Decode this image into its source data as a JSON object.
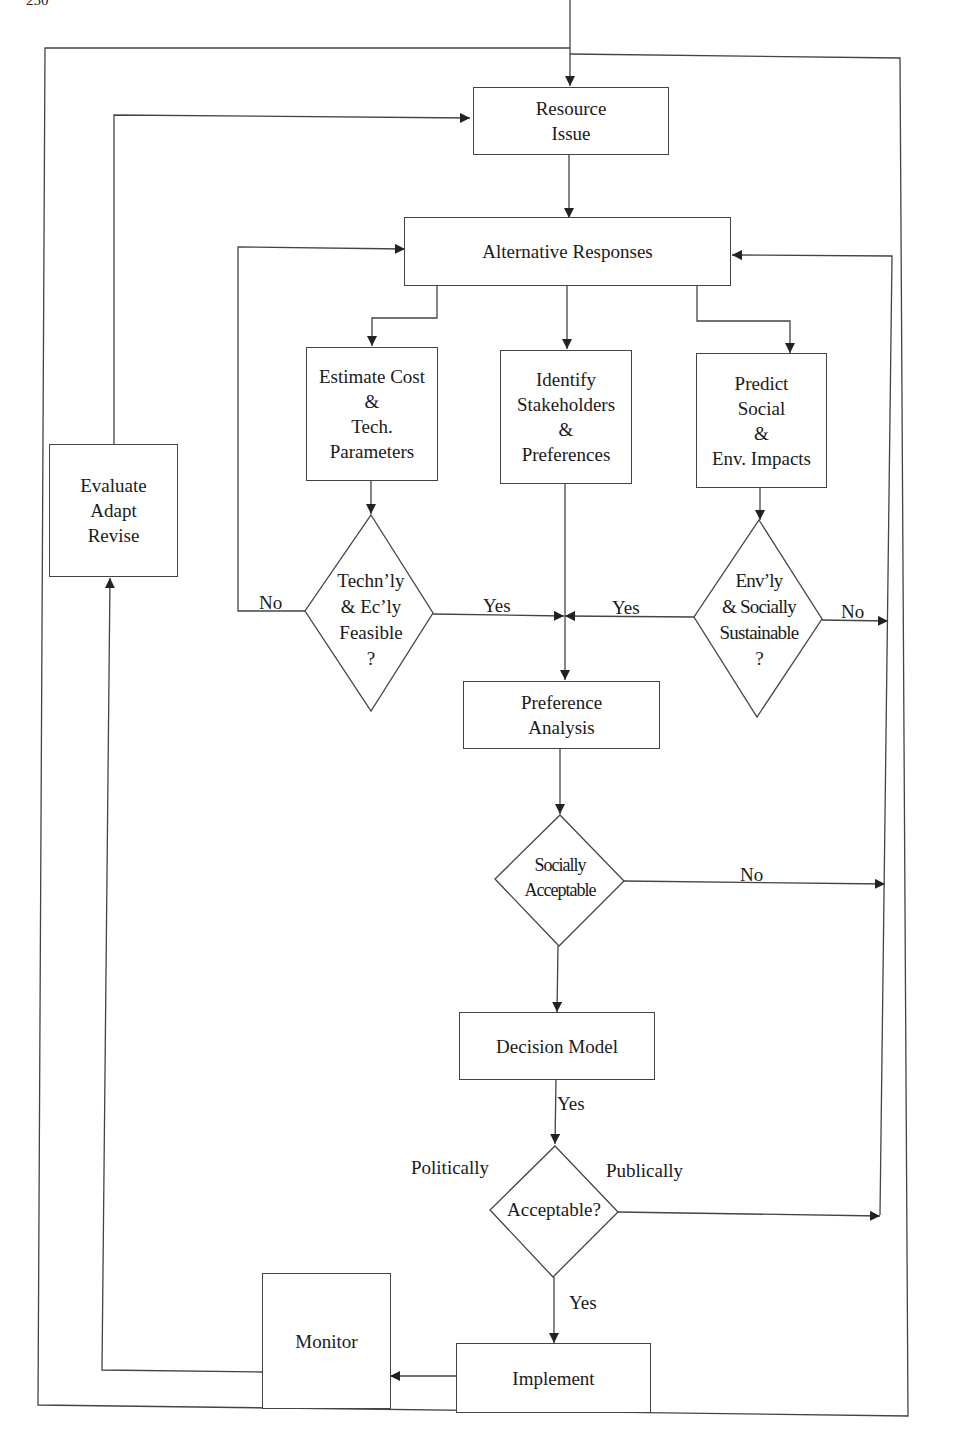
{
  "page_number": "250",
  "nodes": {
    "resource_issue": [
      "Resource",
      "Issue"
    ],
    "alternative_responses": [
      "Alternative Responses"
    ],
    "estimate_cost": [
      "Estimate Cost",
      "&",
      "Tech.",
      "Parameters"
    ],
    "identify_stakeholders": [
      "Identify",
      "Stakeholders",
      "&",
      "Preferences"
    ],
    "predict_impacts": [
      "Predict",
      "Social",
      "&",
      "Env. Impacts"
    ],
    "feasible_decision": [
      "Techn’ly",
      "& Ec’ly",
      "Feasible",
      "?"
    ],
    "sustainable_decision": [
      "Env’ly",
      "& Socially",
      "Sustainable",
      "?"
    ],
    "preference_analysis": [
      "Preference",
      "Analysis"
    ],
    "socially_acceptable_decision": [
      "Socially",
      "Acceptable"
    ],
    "decision_model": [
      "Decision Model"
    ],
    "acceptable_decision": [
      "Acceptable?"
    ],
    "implement": [
      "Implement"
    ],
    "monitor": [
      "Monitor"
    ],
    "evaluate": [
      "Evaluate",
      "Adapt",
      "Revise"
    ]
  },
  "edge_labels": {
    "feasible_no": "No",
    "feasible_yes": "Yes",
    "sustainable_yes": "Yes",
    "sustainable_no": "No",
    "socially_no": "No",
    "decision_yes": "Yes",
    "politically": "Politically",
    "publically": "Publically",
    "acceptable_yes": "Yes"
  }
}
